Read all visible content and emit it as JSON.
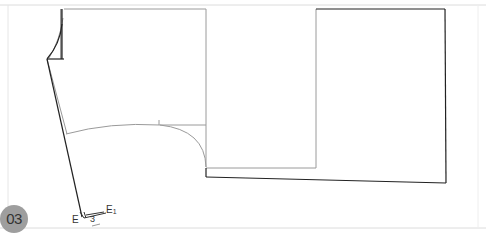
{
  "figure": {
    "number": "03",
    "labels": {
      "point_e": "E",
      "point_e1": "E1",
      "point_e1_main": "E",
      "point_e1_sub": "1",
      "measure": "3"
    },
    "colors": {
      "dark_line": "#222222",
      "light_line": "#9a9a9a",
      "frame_line": "#dcdcdc",
      "badge_bg": "#9e9e9e",
      "badge_text": "#333333"
    }
  }
}
